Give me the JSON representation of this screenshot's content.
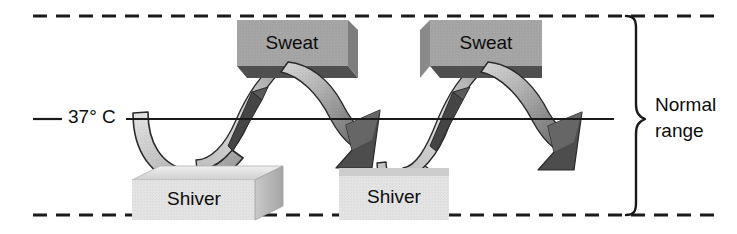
{
  "figure": {
    "type": "diagram",
    "background_color": "#ffffff"
  },
  "axis": {
    "setpoint_label": "37° C",
    "setpoint_value": 37,
    "setpoint_unit": "° C",
    "line_color": "#1a1a1a",
    "line_y": 119
  },
  "bounds": {
    "upper_boundary_style": "dashed",
    "lower_boundary_style": "dashed",
    "boundary_color": "#1a1a1a",
    "upper_y": 16,
    "lower_y": 215
  },
  "bracket": {
    "label_line1": "Normal",
    "label_line2": "range",
    "color": "#1a1a1a"
  },
  "blocks": [
    {
      "id": "sweat-1",
      "label": "Sweat",
      "role": "upper-limit-response",
      "face_color": "#a6a6a6",
      "shade_color": "#555555",
      "x": 237,
      "y": 20,
      "width": 111,
      "height": 46
    },
    {
      "id": "sweat-2",
      "label": "Sweat",
      "role": "upper-limit-response",
      "face_color": "#a6a6a6",
      "shade_color": "#555555",
      "x": 430,
      "y": 20,
      "width": 112,
      "height": 46
    },
    {
      "id": "shiver-1",
      "label": "Shiver",
      "role": "lower-limit-response",
      "face_color": "#e2e2e2",
      "shade_color": "#bdbdbd",
      "x": 132,
      "y": 172,
      "width": 123,
      "height": 48
    },
    {
      "id": "shiver-2",
      "label": "Shiver",
      "role": "lower-limit-response",
      "face_color": "#e2e2e2",
      "shade_color": "#c8c8c8",
      "x": 339,
      "y": 172,
      "width": 110,
      "height": 48
    }
  ],
  "ribbons": [
    {
      "id": "ribbon-down-1",
      "direction": "downward",
      "from": "setpoint",
      "to": "shiver-1",
      "fill_light": "#d6d6d6",
      "fill_dark": "#9a9a9a"
    },
    {
      "id": "ribbon-up-1",
      "direction": "upward",
      "from": "shiver-1",
      "to": "sweat-1",
      "fill_light": "#d0d0d0",
      "fill_dark": "#8f8f8f"
    },
    {
      "id": "ribbon-down-2",
      "direction": "downward",
      "from": "sweat-1",
      "to": "shiver-2",
      "fill_light": "#cccccc",
      "fill_dark": "#7d7d7d"
    },
    {
      "id": "ribbon-up-2",
      "direction": "upward",
      "from": "shiver-2",
      "to": "sweat-2",
      "fill_light": "#d0d0d0",
      "fill_dark": "#8f8f8f"
    },
    {
      "id": "ribbon-down-3",
      "direction": "downward",
      "from": "sweat-2",
      "to": "lower-bound",
      "fill_light": "#cccccc",
      "fill_dark": "#7d7d7d"
    }
  ]
}
